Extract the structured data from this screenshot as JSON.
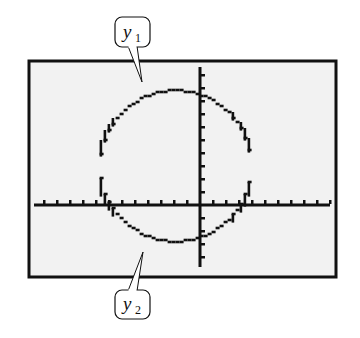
{
  "chart_data": {
    "type": "line",
    "title": "",
    "xlabel": "",
    "ylabel": "",
    "grid": false,
    "legend": "callouts",
    "xlim": [
      -12.8,
      10
    ],
    "ylim": [
      -4.8,
      10.5
    ],
    "x_tick_spacing": 1,
    "y_tick_spacing": 1,
    "circle": {
      "center": [
        -2,
        3
      ],
      "radius": 5.8
    },
    "series": [
      {
        "name": "y1",
        "equation": "y1 = 3 + sqrt(33.64 - (x + 2)^2)",
        "x": [
          -7.8,
          -7,
          -6,
          -5,
          -4,
          -3,
          -2,
          -1,
          0,
          1,
          2,
          3,
          3.8
        ],
        "values": [
          4.2,
          6.1,
          7.2,
          7.9,
          8.4,
          8.7,
          8.8,
          8.7,
          8.4,
          7.9,
          7.2,
          6.1,
          4.2
        ]
      },
      {
        "name": "y2",
        "equation": "y2 = 3 - sqrt(33.64 - (x + 2)^2)",
        "x": [
          -7.8,
          -7,
          -6,
          -5,
          -4,
          -3,
          -2,
          -1,
          0,
          1,
          2,
          3,
          3.8
        ],
        "values": [
          1.8,
          -0.1,
          -1.2,
          -1.9,
          -2.4,
          -2.7,
          -2.8,
          -2.7,
          -2.4,
          -1.9,
          -1.2,
          -0.1,
          1.8
        ]
      }
    ],
    "annotations": [
      {
        "text": "y",
        "subscript": "1",
        "points_to": "upper semicircle"
      },
      {
        "text": "y",
        "subscript": "2",
        "points_to": "lower semicircle"
      }
    ]
  },
  "callouts": {
    "top": {
      "var": "y",
      "sub": "1"
    },
    "bottom": {
      "var": "y",
      "sub": "2"
    }
  },
  "colors": {
    "screen_bg": "#f2f2f2",
    "frame": "#111111",
    "plot": "#111111"
  },
  "layout": {
    "frame": {
      "x": 29,
      "y": 61,
      "w": 307,
      "h": 216
    },
    "origin_px": {
      "x": 200,
      "y": 205
    },
    "px_per_unit": 13,
    "x_axis_px": [
      34,
      330
    ],
    "y_axis_px": [
      67,
      267
    ]
  }
}
